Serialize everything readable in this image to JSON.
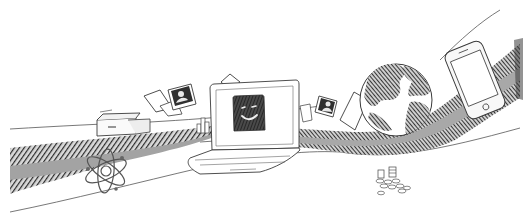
{
  "illustration": {
    "style": "hand-drawn black-and-white sketch",
    "colors": {
      "background": "#ffffff",
      "ink": "#3a3a3a",
      "hatch_dark": "#2b2b2b",
      "road_gray": "#9a9a9a"
    },
    "objects": [
      {
        "name": "printer-box",
        "icon": "printer-icon"
      },
      {
        "name": "paper-sheets",
        "icon": "paper-icon"
      },
      {
        "name": "photo-card-left",
        "icon": "photo-icon"
      },
      {
        "name": "building-bars",
        "icon": "chart-bars-icon"
      },
      {
        "name": "laptop-smiley",
        "icon": "laptop-icon"
      },
      {
        "name": "atom",
        "icon": "atom-icon"
      },
      {
        "name": "photo-card-right",
        "icon": "photo-icon"
      },
      {
        "name": "globe",
        "icon": "globe-icon"
      },
      {
        "name": "smartphone",
        "icon": "phone-icon"
      },
      {
        "name": "coins-pile",
        "icon": "coins-icon"
      }
    ]
  }
}
